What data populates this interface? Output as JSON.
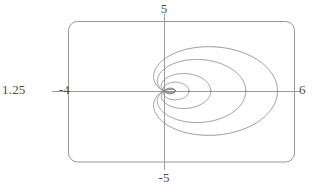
{
  "figure": {
    "title": "",
    "background_color": "#ffffff",
    "frame": {
      "stroke_color": "#9a9595",
      "corner_radius": 9,
      "left": 68,
      "top": 21,
      "right": 295,
      "bottom": 162
    },
    "axes": {
      "stroke_color": "#a09b9b",
      "origin_x": 164,
      "origin_y": 91
    }
  },
  "labels": {
    "y_max": "5",
    "y_min": "-5",
    "x_min": "-4",
    "x_max": "6",
    "scale": "1.25"
  },
  "chart_data": {
    "type": "line",
    "title": "",
    "xlabel": "",
    "ylabel": "",
    "xlim": [
      -4,
      6
    ],
    "ylim": [
      -5,
      5
    ],
    "grid": false,
    "legend": null,
    "coordinate_system": "polar-limacon-family",
    "axis_tick_labels": {
      "x": [
        "-4",
        "6"
      ],
      "y": [
        "-5",
        "5"
      ]
    },
    "annotations": [
      "1.25"
    ],
    "curve_color": "#8a8585",
    "series": [
      {
        "name": "limacon-1-outer",
        "type": "limacon",
        "a": 2.25,
        "b": 2.75,
        "x_right": 5.0,
        "x_left_cusp": -0.5,
        "y_max": 3.55,
        "y_min": -3.55,
        "inner_loop": false
      },
      {
        "name": "limacon-2",
        "type": "limacon",
        "a": 1.55,
        "b": 2.05,
        "x_right": 3.6,
        "x_left_cusp": -0.5,
        "y_max": 2.45,
        "y_min": -2.45,
        "inner_loop": false
      },
      {
        "name": "limacon-3",
        "type": "limacon",
        "a": 0.78,
        "b": 1.28,
        "x_right": 2.06,
        "x_left_cusp": -0.5,
        "y_max": 1.38,
        "y_min": -1.38,
        "inner_loop": true
      },
      {
        "name": "limacon-4-inner",
        "type": "limacon",
        "a": 0.3,
        "b": 0.8,
        "x_right": 1.1,
        "x_left_cusp": -0.5,
        "y_max": 0.66,
        "y_min": -0.66,
        "inner_loop": true
      }
    ]
  }
}
